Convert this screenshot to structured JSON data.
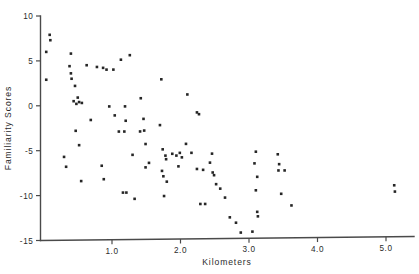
{
  "chart_data": {
    "type": "scatter",
    "title": "",
    "xlabel": "Kilometers",
    "ylabel": "Familiarity  Scores",
    "xlim": [
      0.0,
      5.55
    ],
    "ylim": [
      -15,
      10
    ],
    "grid": false,
    "legend": null,
    "xticks": [
      1.0,
      2.0,
      3.0,
      4.0,
      5.0
    ],
    "xticklabels": [
      "1.0",
      "2.0",
      "3.0",
      "4.0",
      "5.0"
    ],
    "yticks": [
      10,
      5,
      0,
      -5,
      -10,
      -15
    ],
    "yticklabels": [
      "10",
      "5",
      "0",
      "-5",
      "-10",
      "-15"
    ],
    "marker": "square",
    "marker_color": "#262626",
    "marker_size": 2.6,
    "points": [
      [
        0.09,
        7.9
      ],
      [
        0.1,
        7.3
      ],
      [
        0.04,
        6.0
      ],
      [
        0.04,
        2.9
      ],
      [
        0.4,
        5.8
      ],
      [
        0.38,
        4.4
      ],
      [
        0.4,
        3.6
      ],
      [
        0.41,
        3.0
      ],
      [
        0.46,
        2.2
      ],
      [
        0.44,
        0.5
      ],
      [
        0.5,
        0.9
      ],
      [
        0.52,
        0.4
      ],
      [
        0.48,
        0.2
      ],
      [
        0.56,
        0.3
      ],
      [
        0.63,
        4.5
      ],
      [
        0.69,
        -1.6
      ],
      [
        0.3,
        -5.7
      ],
      [
        0.33,
        -6.8
      ],
      [
        0.47,
        -2.8
      ],
      [
        0.52,
        -4.4
      ],
      [
        0.55,
        -8.4
      ],
      [
        0.78,
        4.3
      ],
      [
        0.87,
        4.2
      ],
      [
        0.92,
        4.0
      ],
      [
        1.02,
        4.0
      ],
      [
        0.96,
        -0.1
      ],
      [
        1.04,
        -1.1
      ],
      [
        1.13,
        5.1
      ],
      [
        1.1,
        -2.9
      ],
      [
        1.18,
        -2.9
      ],
      [
        0.85,
        -6.7
      ],
      [
        0.88,
        -8.2
      ],
      [
        1.26,
        5.6
      ],
      [
        1.19,
        -0.1
      ],
      [
        1.2,
        -1.7
      ],
      [
        1.3,
        -5.5
      ],
      [
        1.16,
        -9.7
      ],
      [
        1.21,
        -9.7
      ],
      [
        1.33,
        -10.4
      ],
      [
        1.46,
        -1.5
      ],
      [
        1.47,
        -2.8
      ],
      [
        1.49,
        -4.3
      ],
      [
        1.42,
        0.8
      ],
      [
        1.41,
        -2.9
      ],
      [
        1.54,
        -6.4
      ],
      [
        1.49,
        -6.9
      ],
      [
        1.72,
        2.9
      ],
      [
        1.7,
        -2.2
      ],
      [
        1.74,
        -4.9
      ],
      [
        1.78,
        -5.6
      ],
      [
        1.79,
        -6.0
      ],
      [
        1.73,
        -7.3
      ],
      [
        1.75,
        -7.9
      ],
      [
        1.8,
        -8.5
      ],
      [
        1.76,
        -10.1
      ],
      [
        1.88,
        -5.4
      ],
      [
        1.94,
        -5.6
      ],
      [
        1.99,
        -5.3
      ],
      [
        2.02,
        -5.8
      ],
      [
        1.97,
        -6.8
      ],
      [
        2.1,
        1.2
      ],
      [
        2.08,
        -4.3
      ],
      [
        2.16,
        -5.3
      ],
      [
        2.24,
        -0.8
      ],
      [
        2.27,
        -1.0
      ],
      [
        2.24,
        -7.1
      ],
      [
        2.33,
        -7.2
      ],
      [
        2.29,
        -11.0
      ],
      [
        2.36,
        -11.0
      ],
      [
        2.46,
        -5.4
      ],
      [
        2.43,
        -6.4
      ],
      [
        2.47,
        -7.5
      ],
      [
        2.49,
        -7.8
      ],
      [
        2.52,
        -8.8
      ],
      [
        2.58,
        -9.3
      ],
      [
        2.65,
        -10.3
      ],
      [
        2.72,
        -12.5
      ],
      [
        2.81,
        -13.1
      ],
      [
        2.88,
        -14.2
      ],
      [
        3.05,
        -14.1
      ],
      [
        3.12,
        -11.9
      ],
      [
        3.13,
        -12.4
      ],
      [
        3.1,
        -5.2
      ],
      [
        3.08,
        -6.5
      ],
      [
        3.12,
        -8.0
      ],
      [
        3.1,
        -9.5
      ],
      [
        3.42,
        -5.5
      ],
      [
        3.44,
        -6.6
      ],
      [
        3.43,
        -7.3
      ],
      [
        3.52,
        -7.3
      ],
      [
        3.47,
        -9.9
      ],
      [
        3.62,
        -11.2
      ],
      [
        5.12,
        -9.0
      ],
      [
        5.13,
        -9.7
      ]
    ]
  },
  "axes": {
    "x_axis_name": "x-axis",
    "y_axis_name": "y-axis"
  }
}
